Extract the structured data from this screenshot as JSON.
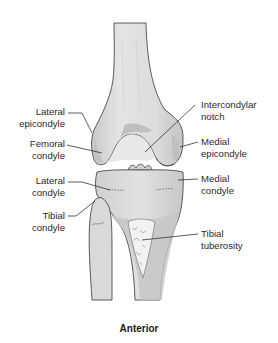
{
  "figure": {
    "view": "Anterior",
    "bones": [
      "femur",
      "patella-region",
      "tibia",
      "fibula"
    ],
    "colors": {
      "bone_fill": "#dedede",
      "bone_shade": "#bdbdbd",
      "bone_dark": "#a9a9a9",
      "outline": "#4a4a4a",
      "leader_line": "#333333",
      "text": "#2a2a2a"
    }
  },
  "labels": {
    "lateral_epicondyle": {
      "line1": "Lateral",
      "line2": "epicondyle"
    },
    "femoral_condyle": {
      "line1": "Femoral",
      "line2": "condyle"
    },
    "intercondylar_notch": {
      "line1": "Intercondylar",
      "line2": "notch"
    },
    "medial_epicondyle": {
      "line1": "Medial",
      "line2": "epicondyle"
    },
    "lateral_condyle": {
      "line1": "Lateral",
      "line2": "condyle"
    },
    "medial_condyle": {
      "line1": "Medial",
      "line2": "condyle"
    },
    "tibial_condyle": {
      "line1": "Tibial",
      "line2": "condyle"
    },
    "tibial_tuberosity": {
      "line1": "Tibial",
      "line2": "tuberosity"
    }
  },
  "caption": "Anterior"
}
